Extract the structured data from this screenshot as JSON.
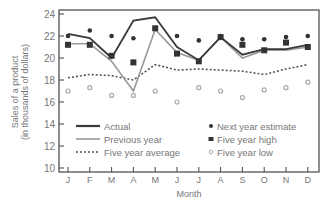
{
  "chart_data": {
    "type": "line",
    "title": "",
    "xlabel": "Month",
    "ylabel": "Sales of a product (in thousands of dollars)",
    "ylabel_lines": [
      "Sales of a product",
      "(in thousands of dollars)"
    ],
    "ylim": [
      10,
      24
    ],
    "yticks": [
      10,
      12,
      14,
      16,
      18,
      20,
      22,
      24
    ],
    "grid": false,
    "legend_position": "inside lower area",
    "categories": [
      "J",
      "F",
      "M",
      "A",
      "M",
      "J",
      "J",
      "A",
      "S",
      "O",
      "N",
      "D"
    ],
    "series": [
      {
        "name": "Actual",
        "style": "thick-line",
        "values": [
          22.2,
          21.8,
          20.0,
          23.4,
          23.7,
          21.0,
          19.8,
          21.9,
          20.3,
          20.8,
          20.8,
          21.2
        ]
      },
      {
        "name": "Previous year",
        "style": "gray-line",
        "values": [
          21.3,
          21.3,
          19.7,
          17.0,
          22.6,
          20.5,
          19.8,
          21.9,
          20.0,
          20.7,
          20.7,
          21.0
        ]
      },
      {
        "name": "Five year average",
        "style": "dotted-line",
        "values": [
          18.2,
          18.5,
          18.4,
          18.0,
          19.4,
          18.9,
          19.0,
          18.9,
          18.8,
          18.5,
          19.0,
          19.4
        ]
      },
      {
        "name": "Next year estimate",
        "style": "filled-circle",
        "values": [
          22.0,
          22.5,
          22.0,
          21.8,
          null,
          22.0,
          21.6,
          22.0,
          21.7,
          21.7,
          21.9,
          22.0
        ]
      },
      {
        "name": "Five year high",
        "style": "filled-square",
        "values": [
          21.2,
          21.2,
          20.2,
          19.6,
          22.7,
          20.4,
          19.7,
          21.9,
          21.2,
          20.7,
          21.4,
          21.0
        ]
      },
      {
        "name": "Five year low",
        "style": "open-circle",
        "values": [
          17.0,
          17.3,
          16.6,
          16.6,
          17.0,
          16.0,
          17.3,
          17.0,
          16.4,
          17.1,
          17.3,
          17.8
        ]
      }
    ],
    "legend": [
      "Actual",
      "Previous year",
      "Five year average",
      "Next year estimate",
      "Five year high",
      "Five year low"
    ]
  },
  "colors": {
    "actual": "#3a3a3a",
    "previous": "#999999",
    "average": "#555555",
    "estimate": "#333333",
    "high": "#333333",
    "low": "#aaaaaa",
    "axis": "#444444",
    "text": "#777777"
  }
}
